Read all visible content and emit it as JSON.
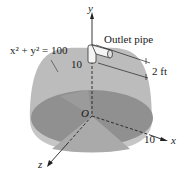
{
  "figure": {
    "equation_label": "x² + y² = 100",
    "outlet_label": "Outlet pipe",
    "pipe_length_label": "2 ft",
    "radius_label_y": "10",
    "radius_label_x": "10",
    "origin_label": "O",
    "axes": {
      "x": "x",
      "y": "y",
      "z": "z"
    },
    "colors": {
      "dome": "#b9b9b9",
      "base_disk": "#8f8f8f",
      "cone_wedge": "#a8a8a8",
      "rim_front": "#c4c4c4",
      "axis": "#222222",
      "background": "#ffffff"
    }
  }
}
